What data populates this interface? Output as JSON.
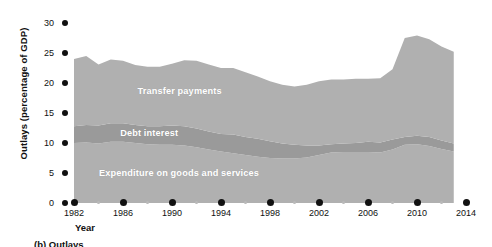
{
  "figure": {
    "caption": "(b) Outlays"
  },
  "chart_data": {
    "type": "area",
    "title": "",
    "subtitle": "",
    "xlabel": "Year",
    "ylabel": "Outlays (percentage of GDP)",
    "xlim": [
      1982,
      2014
    ],
    "ylim": [
      0,
      30
    ],
    "grid": false,
    "legend_position": "inline-band-labels",
    "stacked": true,
    "y_ticks": [
      0,
      5,
      10,
      15,
      20,
      25,
      30
    ],
    "y_tick_labels": [
      "0",
      "5",
      "10",
      "15",
      "20",
      "25",
      "30"
    ],
    "x_ticks_major": [
      1982,
      1986,
      1990,
      1994,
      1998,
      2002,
      2006,
      2010,
      2014
    ],
    "x_tick_labels": [
      "1982",
      "1986",
      "1990",
      "1994",
      "1998",
      "2002",
      "2006",
      "2010",
      "2014"
    ],
    "x_ticks_minor": [
      1984,
      1988,
      1992,
      1996,
      2000,
      2004,
      2008,
      2012
    ],
    "x": [
      1982,
      1983,
      1984,
      1985,
      1986,
      1987,
      1988,
      1989,
      1990,
      1991,
      1992,
      1993,
      1994,
      1995,
      1996,
      1997,
      1998,
      1999,
      2000,
      2001,
      2002,
      2003,
      2004,
      2005,
      2006,
      2007,
      2008,
      2009,
      2010,
      2011,
      2012,
      2013
    ],
    "series": [
      {
        "name": "Expenditure on goods and services",
        "color": "#b0b0b0",
        "label_color": "#ffffff",
        "values": [
          10.0,
          10.1,
          9.9,
          10.2,
          10.2,
          10.0,
          9.8,
          9.7,
          9.7,
          9.6,
          9.3,
          8.9,
          8.6,
          8.3,
          8.0,
          7.7,
          7.5,
          7.4,
          7.4,
          7.6,
          8.0,
          8.4,
          8.5,
          8.5,
          8.5,
          8.4,
          8.9,
          9.7,
          9.8,
          9.5,
          9.0,
          8.6
        ]
      },
      {
        "name": "Debt interest",
        "color": "#9a9a9a",
        "label_color": "#ffffff",
        "values": [
          2.8,
          2.9,
          3.0,
          3.1,
          3.1,
          3.0,
          3.0,
          3.1,
          3.2,
          3.2,
          3.1,
          3.0,
          2.9,
          3.1,
          3.0,
          3.0,
          2.8,
          2.5,
          2.3,
          2.0,
          1.6,
          1.4,
          1.4,
          1.5,
          1.7,
          1.7,
          1.7,
          1.3,
          1.4,
          1.5,
          1.4,
          1.3
        ]
      },
      {
        "name": "Transfer payments",
        "color": "#b0b0b0",
        "label_color": "#ffffff",
        "values": [
          11.2,
          11.5,
          10.2,
          10.6,
          10.4,
          10.0,
          9.9,
          9.9,
          10.3,
          11.0,
          11.3,
          11.2,
          11.0,
          11.1,
          10.8,
          10.4,
          10.0,
          9.8,
          9.7,
          10.1,
          10.7,
          10.8,
          10.7,
          10.7,
          10.5,
          10.7,
          11.7,
          16.5,
          16.7,
          16.3,
          15.7,
          15.3
        ]
      }
    ],
    "band_labels": [
      {
        "text": "Transfer payments",
        "x_pct": 17.0,
        "y_px": 86
      },
      {
        "text": "Debt interest",
        "x_pct": 12.5,
        "y_px": 128
      },
      {
        "text": "Expenditure on goods and services",
        "x_pct": 7.0,
        "y_px": 168
      }
    ]
  }
}
